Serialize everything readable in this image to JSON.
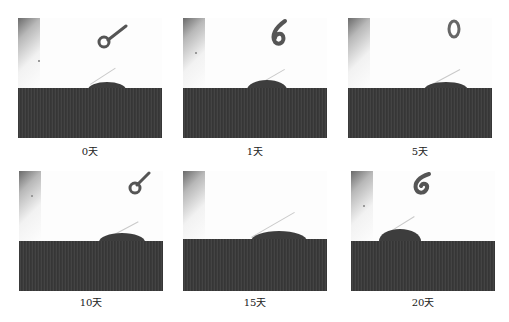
{
  "figure": {
    "panels": [
      {
        "id": "day0",
        "label": "0天",
        "needle": "loop-needle"
      },
      {
        "id": "day1",
        "label": "1天",
        "needle": "hook-needle"
      },
      {
        "id": "day5",
        "label": "5天",
        "needle": "ring-needle"
      },
      {
        "id": "day10",
        "label": "10天",
        "needle": "loop-needle"
      },
      {
        "id": "day15",
        "label": "15天",
        "needle": "none"
      },
      {
        "id": "day20",
        "label": "20天",
        "needle": "hook-needle"
      }
    ],
    "colors": {
      "substrate": "#3a3a3a",
      "droplet": "#3d3d3d",
      "background": "#ffffff",
      "tangent_line": "#c9c9c9"
    }
  }
}
